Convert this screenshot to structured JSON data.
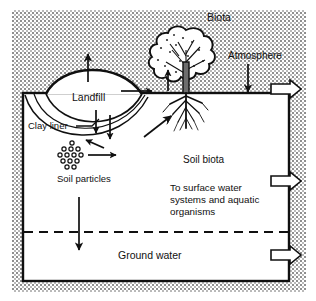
{
  "figure": {
    "colors": {
      "ink": "#101010",
      "background": "#ffffff",
      "stipple": "#9a9a9a",
      "soil_fill": "#ffffff"
    }
  },
  "labels": {
    "biota": "Biota",
    "atmosphere": "Atmosphere",
    "landfill": "Landfill",
    "clay_liner": "Clay liner",
    "soil_particles": "Soil particles",
    "soil_biota": "Soil biota",
    "surface_water_line1": "To surface water",
    "surface_water_line2": "systems and aquatic",
    "surface_water_line3": "organisms",
    "ground_water": "Ground water"
  },
  "regions": [
    {
      "name": "atmosphere-region",
      "description": "stippled area above ground surface"
    },
    {
      "name": "vadose-zone",
      "description": "white unsaturated soil zone below ground surface"
    },
    {
      "name": "saturated-zone",
      "description": "ground water zone below the dashed water table"
    }
  ],
  "flow_arrows": [
    {
      "name": "landfill-volatilization-arrow",
      "direction": "up",
      "location": "above landfill dome"
    },
    {
      "name": "surface-runoff-arrow",
      "direction": "right",
      "location": "along ground surface"
    },
    {
      "name": "plant-uptake-arrow",
      "direction": "up",
      "location": "at tree trunk base"
    },
    {
      "name": "atmospheric-deposition-arrow",
      "direction": "down",
      "location": "below Atmosphere label"
    },
    {
      "name": "leachate-arrow-left",
      "direction": "down",
      "location": "through clay liner"
    },
    {
      "name": "leachate-arrow-right",
      "direction": "down",
      "location": "through clay liner"
    },
    {
      "name": "sorption-arrow",
      "direction": "down-left diagonal",
      "location": "toward soil particles"
    },
    {
      "name": "soil-particle-transport-arrow",
      "direction": "right",
      "location": "from soil particle cluster"
    },
    {
      "name": "root-uptake-arrow",
      "direction": "up-right diagonal",
      "location": "toward tree roots"
    },
    {
      "name": "infiltration-arrow",
      "direction": "down",
      "location": "crossing water table"
    },
    {
      "name": "atmosphere-outflow-arrow",
      "direction": "right",
      "location": "right edge, ground surface level"
    },
    {
      "name": "surface-water-outflow-arrow",
      "direction": "right",
      "location": "right edge, vadose zone"
    },
    {
      "name": "groundwater-outflow-arrow",
      "direction": "right",
      "location": "right edge, saturated zone"
    }
  ],
  "water_table": {
    "name": "water-table-line",
    "style": "dashed"
  }
}
